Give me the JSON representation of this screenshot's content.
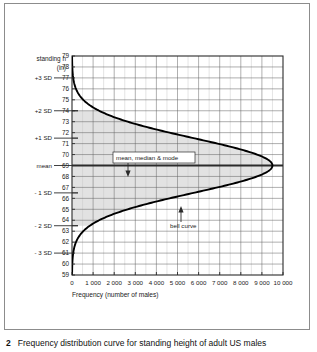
{
  "figure": {
    "caption_number": "2",
    "caption_text": "Frequency distribution curve for standing height of adult US males"
  },
  "axes": {
    "y_axis_title_line1": "standing h",
    "y_axis_title_line2": "(in)",
    "x_axis_title": "Frequency (number of males)",
    "y_ticks": [
      "79",
      "78",
      "77",
      "76",
      "75",
      "74",
      "73",
      "72",
      "71",
      "70",
      "69",
      "68",
      "67",
      "66",
      "65",
      "64",
      "63",
      "62",
      "61",
      "60",
      "59"
    ],
    "y_min": 59,
    "y_max": 79,
    "x_ticks": [
      "0",
      "1 000",
      "2 000",
      "3 000",
      "4 000",
      "5 000",
      "6 000",
      "7 000",
      "8 000",
      "9 000",
      "10 000"
    ],
    "x_min": 0,
    "x_max": 10000,
    "x_tick_step": 1000,
    "x_minor_step": 500
  },
  "sd_markers": [
    {
      "label": "+3 SD",
      "value": 77
    },
    {
      "label": "+2 SD",
      "value": 74
    },
    {
      "label": "+1 SD",
      "value": 71.5
    },
    {
      "label": "mean",
      "value": 69
    },
    {
      "label": "- 1 SD",
      "value": 66.5
    },
    {
      "label": "- 2 SD",
      "value": 63.5
    },
    {
      "label": "- 3 SD",
      "value": 61
    }
  ],
  "annotations": {
    "mean_box_label": "mean, median & mode",
    "bell_curve_label": "bell curve"
  },
  "colors": {
    "frame_border": "#8c8c8c",
    "grid_major": "#6b6b6b",
    "grid_minor": "#c9c9c9",
    "curve": "#000000",
    "shaded_region": "#e2e2e2",
    "mean_line": "#2b2b2b",
    "text": "#1a1a1a"
  },
  "chart_data": {
    "type": "line",
    "title": "",
    "xlabel": "Frequency (number of males)",
    "ylabel": "standing h (in)",
    "xlim": [
      0,
      10000
    ],
    "ylim": [
      59,
      79
    ],
    "grid": true,
    "legend": "none",
    "orientation": "horizontal-bell",
    "distribution": {
      "mean": 69,
      "sd": 2.5,
      "peak_frequency": 9500
    },
    "shaded_band": {
      "from": 63.5,
      "to": 74,
      "description": "area under curve between -2 SD and +2 SD"
    },
    "series": [
      {
        "name": "frequency distribution",
        "y": [
          79,
          78.5,
          78,
          77.5,
          77,
          76.5,
          76,
          75.5,
          75,
          74.5,
          74,
          73.5,
          73,
          72.5,
          72,
          71.5,
          71,
          70.5,
          70,
          69.5,
          69,
          68.5,
          68,
          67.5,
          67,
          66.5,
          66,
          65.5,
          65,
          64.5,
          64,
          63.5,
          63,
          62.5,
          62,
          61.5,
          61,
          60.5,
          60,
          59.5,
          59
        ],
        "values": [
          30,
          60,
          110,
          200,
          330,
          530,
          800,
          1180,
          1660,
          2260,
          2960,
          3740,
          4580,
          5430,
          6270,
          7040,
          7720,
          8270,
          8690,
          8980,
          9500,
          8980,
          8690,
          8270,
          7720,
          7040,
          6270,
          5430,
          4580,
          3740,
          2960,
          2260,
          1660,
          1180,
          800,
          530,
          330,
          200,
          110,
          60,
          30
        ]
      }
    ],
    "annotations": [
      {
        "text": "mean, median & mode",
        "points_to_y": 69
      },
      {
        "text": "bell curve",
        "points_to_y": 65.2
      }
    ]
  }
}
